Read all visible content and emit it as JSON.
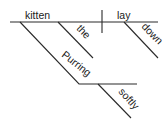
{
  "diagram": {
    "type": "sentence-diagram",
    "subject": "kitten",
    "verb": "lay",
    "modifiers": {
      "article": "the",
      "adverb_verb": "down",
      "participle": "Purring",
      "adverb_participle": "softly"
    },
    "colors": {
      "line": "#2a2a2a",
      "text": "#1a1a1a",
      "background": "#ffffff"
    }
  }
}
